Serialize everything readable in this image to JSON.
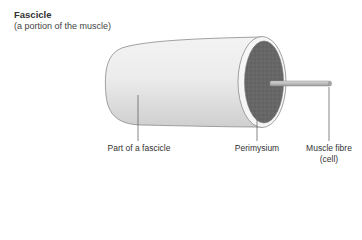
{
  "title": "Fascicle",
  "subtitle": "(a portion of the muscle)",
  "labels": {
    "fascicle_part": "Part of a fascicle",
    "perimysium": "Perimysium",
    "muscle_fibre_line1": "Muscle fibre",
    "muscle_fibre_line2": "(cell)"
  },
  "colors": {
    "cylinder_body": "#e4e4e4",
    "end_face": "#6b6b6b",
    "rim": "#f4f4f4",
    "outline": "#8a8a8a",
    "fibre": "#b8b8b8",
    "leader_line": "#555555"
  }
}
